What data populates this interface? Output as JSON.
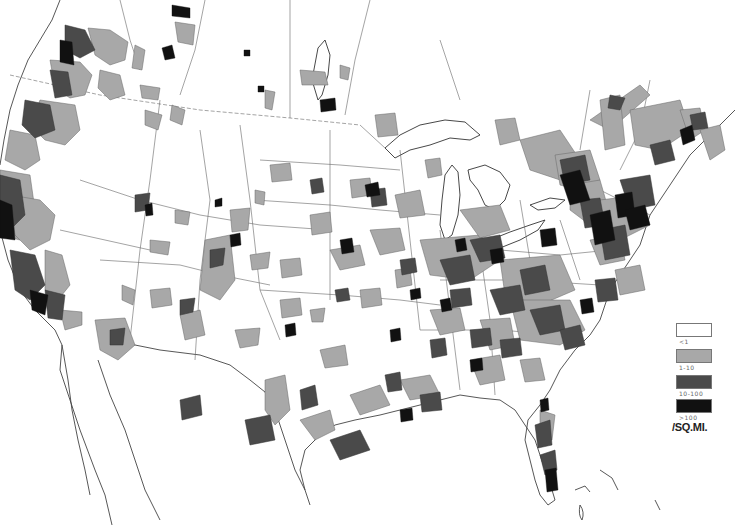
{
  "map": {
    "subject": "Population density by county, United States and southern Canada",
    "colors": {
      "background": "#ffffff",
      "boundary": "#555555",
      "class_lt1": "#ffffff",
      "class_1_10": "#a8a8a8",
      "class_10_100": "#4a4a4a",
      "class_gt100": "#111111"
    }
  },
  "legend": {
    "items": [
      {
        "label": "<1",
        "color": "#ffffff"
      },
      {
        "label": "1-10",
        "color": "#a8a8a8"
      },
      {
        "label": "10-100",
        "color": "#4a4a4a"
      },
      {
        "label": ">100",
        "color": "#111111"
      }
    ],
    "unit": "/SQ.MI."
  }
}
